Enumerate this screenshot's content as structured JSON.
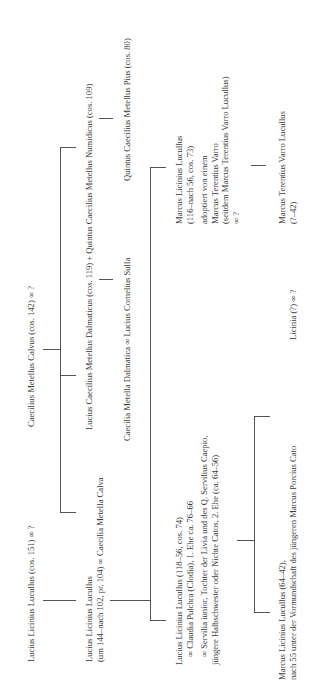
{
  "persons": {
    "lucius_cos151": {
      "lines": [
        "Lucius Licinius Lucullus (cos. 151) ∞ ?"
      ]
    },
    "caecilius_calvus": {
      "lines": [
        "Caecilius Metellus Calvus (cos. 142) ∞ ?"
      ]
    },
    "lucius_pr104": {
      "lines": [
        "Lucius Licinius Lucullus",
        "(um 144–nach 102, pr. 104) ∞ Caecilia Metella Calva"
      ]
    },
    "dalmaticus": {
      "lines": [
        "Lucius Caecilius Metellus Dalmaticus (cos. 119) + Quintus Caecilius Metellus Numidicus (cos. 109)"
      ]
    },
    "metella_dalmatica": {
      "lines": [
        "Caecilia Metella Dalmatica ∞ Lucius Cornelius Sulla"
      ]
    },
    "metellus_pius": {
      "lines": [
        "Quintus Caecilius Metellus Pius (cos. 80)"
      ]
    },
    "lucius_cos74": {
      "lines": [
        "Lucius Licinius Lucullus (118–56, cos. 74)"
      ],
      "spouse1": "∞ Claudia Pulchra (Clodia), 1. Ehe ca. 76–66",
      "spouse2_lines": [
        "∞ Servilia iunior, Tochter der Livia und des Q. Servilius Caepio,",
        "jüngere Halbschwester oder Nichte Catos, 2. Ehe (ca. 64–56)"
      ]
    },
    "marcus_cos73": {
      "lines": [
        "Marcus Licinius Lucullus",
        "(116–nach 56, cos. 73)"
      ],
      "adoption_lines": [
        "adoptiert von einem",
        "Marcus Terentius Varro",
        "(seitdem Marcus Terentius Varro Lucullus)",
        "∞ ?"
      ]
    },
    "marcus_64": {
      "lines": [
        "Marcus Licinius Lucullus (64–42),",
        "nach 55 unter der Vormundschaft des jüngeren Marcus Porcius Cato"
      ]
    },
    "licinia": {
      "lines": [
        "Licinia (?) ∞ ?"
      ]
    },
    "marcus_varro": {
      "lines": [
        "Marcus Terentius Varro Lucullus",
        "(?–42)"
      ]
    }
  }
}
